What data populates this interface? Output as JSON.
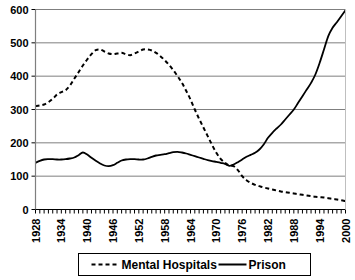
{
  "chart_data": {
    "type": "line",
    "title": "",
    "xlabel": "",
    "ylabel": "",
    "xlim": [
      1928,
      2000
    ],
    "ylim": [
      0,
      600
    ],
    "ytick_values": [
      0,
      100,
      200,
      300,
      400,
      500,
      600
    ],
    "ytick_labels": [
      "0",
      "100",
      "200",
      "300",
      "400",
      "500",
      "600"
    ],
    "xtick_labels": [
      "1928",
      "1934",
      "1940",
      "1946",
      "1952",
      "1958",
      "1964",
      "1970",
      "1976",
      "1982",
      "1988",
      "1994",
      "2000"
    ],
    "xtick_values": [
      1928,
      1934,
      1940,
      1946,
      1952,
      1958,
      1964,
      1970,
      1976,
      1982,
      1988,
      1994,
      2000
    ],
    "grid": "horizontal",
    "legend_position": "bottom",
    "x": [
      1928,
      1929,
      1930,
      1931,
      1932,
      1933,
      1934,
      1935,
      1936,
      1937,
      1938,
      1939,
      1940,
      1941,
      1942,
      1943,
      1944,
      1945,
      1946,
      1947,
      1948,
      1949,
      1950,
      1951,
      1952,
      1953,
      1954,
      1955,
      1956,
      1957,
      1958,
      1959,
      1960,
      1961,
      1962,
      1963,
      1964,
      1965,
      1966,
      1967,
      1968,
      1969,
      1970,
      1971,
      1972,
      1973,
      1974,
      1975,
      1976,
      1977,
      1978,
      1979,
      1980,
      1981,
      1982,
      1983,
      1984,
      1985,
      1986,
      1987,
      1988,
      1989,
      1990,
      1991,
      1992,
      1993,
      1994,
      1995,
      1996,
      1997,
      1998,
      1999,
      2000
    ],
    "series": [
      {
        "name": "Mental Hospitals",
        "style": "dashed",
        "color": "#000000",
        "values": [
          310,
          312,
          315,
          322,
          332,
          345,
          352,
          358,
          372,
          392,
          412,
          432,
          450,
          466,
          478,
          480,
          474,
          468,
          466,
          468,
          470,
          466,
          463,
          468,
          474,
          480,
          480,
          477,
          470,
          460,
          448,
          434,
          418,
          400,
          380,
          356,
          330,
          300,
          272,
          246,
          220,
          194,
          170,
          152,
          140,
          132,
          130,
          118,
          100,
          88,
          80,
          74,
          70,
          66,
          63,
          60,
          57,
          54,
          52,
          50,
          48,
          46,
          44,
          42,
          40,
          38,
          37,
          36,
          34,
          32,
          30,
          28,
          25
        ]
      },
      {
        "name": "Prison",
        "style": "solid",
        "color": "#000000",
        "values": [
          140,
          146,
          150,
          151,
          151,
          150,
          150,
          151,
          153,
          156,
          163,
          171,
          165,
          155,
          146,
          138,
          132,
          130,
          133,
          140,
          147,
          150,
          151,
          151,
          150,
          150,
          153,
          158,
          162,
          164,
          166,
          169,
          172,
          173,
          171,
          168,
          164,
          160,
          156,
          152,
          148,
          145,
          143,
          140,
          137,
          131,
          135,
          142,
          150,
          158,
          164,
          170,
          180,
          195,
          215,
          230,
          243,
          255,
          270,
          285,
          300,
          320,
          340,
          360,
          380,
          405,
          440,
          480,
          520,
          545,
          562,
          580,
          598
        ]
      }
    ]
  },
  "legend": {
    "items": [
      {
        "label": "Mental Hospitals",
        "style": "dashed"
      },
      {
        "label": "Prison",
        "style": "solid"
      }
    ]
  }
}
